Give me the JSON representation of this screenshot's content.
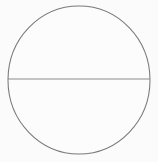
{
  "figure": {
    "caption": "A thin gray circle outline divided into two halves by a horizontal line across its center.",
    "background_color": "#fbfbfb",
    "canvas": {
      "width": 158,
      "height": 162
    },
    "shapes": [
      {
        "name": "circle-outline",
        "type": "ellipse",
        "center_x": 79,
        "center_y": 80,
        "radius_x": 71,
        "radius_y": 74,
        "stroke_color": "#7a7a7a",
        "stroke_width": 1.05,
        "fill_color": "#fcfcfc"
      },
      {
        "name": "horizontal-diameter-line",
        "type": "line",
        "x1": 8,
        "y1": 79,
        "x2": 150,
        "y2": 79,
        "stroke_color": "#8b8b8b",
        "stroke_width": 1
      }
    ],
    "regions": [
      {
        "name": "upper-half",
        "label": "upper semicircle"
      },
      {
        "name": "lower-half",
        "label": "lower semicircle"
      }
    ]
  }
}
